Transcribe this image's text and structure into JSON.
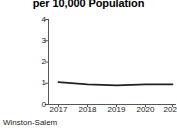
{
  "chart_data": {
    "type": "line",
    "title": "per 10,000 Population",
    "xlabel": "",
    "ylabel": "",
    "categories": [
      "2017",
      "2018",
      "2019",
      "2020",
      "2021"
    ],
    "x": [
      2017,
      2018,
      2019,
      2020,
      2021
    ],
    "series": [
      {
        "name": "Winston-Salem",
        "values": [
          1.05,
          0.95,
          0.9,
          0.95,
          0.95
        ]
      }
    ],
    "yticks": [
      "0",
      "1",
      "2",
      "3",
      "4"
    ],
    "ytick_values": [
      0,
      1,
      2,
      3,
      4
    ],
    "ylim": [
      0,
      4
    ],
    "xlim": [
      2017,
      2021
    ],
    "grid": false,
    "legend": "none",
    "line_color": "#222222",
    "axis_color": "#555555"
  },
  "caption": {
    "source_label": "Winston-Salem"
  }
}
